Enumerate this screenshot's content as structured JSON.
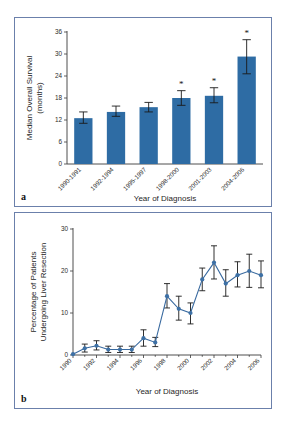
{
  "figure": {
    "panels": [
      {
        "letter": "a"
      },
      {
        "letter": "b"
      }
    ]
  },
  "colors": {
    "bar_blue": "#2e6ca4",
    "line_blue": "#38699f",
    "marker_blue": "#3d70a5",
    "panel_border": "#6b80ab",
    "axis": "#3a3a3a",
    "error_bar": "#1a1a1a"
  },
  "chart_data": [
    {
      "id": "panel-a",
      "panel_letter": "a",
      "type": "bar",
      "title": "",
      "xlabel": "Year of Diagnosis",
      "ylabel": "Median Overall Survival (months)",
      "ylabel_line1": "Median Overall Survival",
      "ylabel_line2": "(months)",
      "categories": [
        "1990-1991",
        "1992-1994",
        "1995-1997",
        "1998-2000",
        "2001-2003",
        "2004-2006"
      ],
      "values": [
        12.5,
        14.2,
        15.5,
        18.0,
        18.6,
        29.3
      ],
      "error_low": [
        11.1,
        13.0,
        14.2,
        16.0,
        16.7,
        24.6
      ],
      "error_high": [
        14.2,
        15.8,
        16.8,
        20.0,
        20.8,
        33.9
      ],
      "significance": [
        "",
        "",
        "",
        "*",
        "*",
        "*"
      ],
      "ylim": [
        0,
        36
      ],
      "yticks": [
        0,
        6,
        12,
        18,
        24,
        30,
        36
      ],
      "ytick_labels": [
        "0",
        "6",
        "12",
        "18",
        "24",
        "30",
        "36"
      ],
      "grid": false,
      "legend": "none"
    },
    {
      "id": "panel-b",
      "panel_letter": "b",
      "type": "line",
      "title": "",
      "xlabel": "Year of Diagnosis",
      "ylabel": "Percentage of Patients Undergoing Liver Resection",
      "ylabel_line1": "Percentage of Patients",
      "ylabel_line2": "Undergoing Liver Resection",
      "x": [
        1990,
        1991,
        1992,
        1993,
        1994,
        1995,
        1996,
        1997,
        1998,
        1999,
        2000,
        2001,
        2002,
        2003,
        2004,
        2005,
        2006
      ],
      "values": [
        0.2,
        1.6,
        2.2,
        1.3,
        1.3,
        1.3,
        4.0,
        3.0,
        14.0,
        11.0,
        10.0,
        18.0,
        22.0,
        17.0,
        19.0,
        20.0,
        19.0
      ],
      "error_low": [
        0.2,
        0.7,
        1.2,
        0.6,
        0.6,
        0.6,
        2.1,
        2.0,
        11.2,
        8.3,
        7.4,
        15.3,
        18.1,
        14.0,
        16.2,
        16.1,
        16.0
      ],
      "error_high": [
        0.2,
        2.6,
        3.4,
        2.1,
        2.1,
        2.1,
        6.0,
        4.2,
        17.0,
        14.0,
        12.4,
        20.7,
        26.0,
        20.3,
        22.2,
        24.0,
        22.4
      ],
      "ylim": [
        0,
        30
      ],
      "yticks": [
        0,
        10,
        20,
        30
      ],
      "ytick_labels": [
        "0",
        "10",
        "20",
        "30"
      ],
      "xtick_labels": [
        "1990",
        "1992",
        "1994",
        "1996",
        "1998",
        "2000",
        "2002",
        "2004",
        "2006"
      ],
      "xticks": [
        1990,
        1992,
        1994,
        1996,
        1998,
        2000,
        2002,
        2004,
        2006
      ],
      "xlim": [
        1990,
        2006
      ],
      "grid": false,
      "legend": "none"
    }
  ]
}
